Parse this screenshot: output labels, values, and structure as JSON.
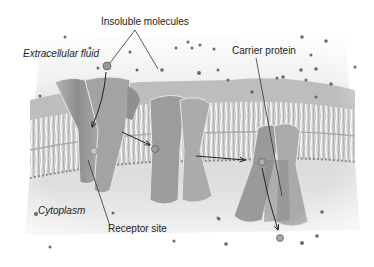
{
  "diagram": {
    "type": "cell-membrane-carrier-transport",
    "labels": {
      "insoluble_molecules": "Insoluble molecules",
      "extracellular_fluid": "Extracellular fluid",
      "carrier_protein": "Carrier protein",
      "cytoplasm": "Cytoplasm",
      "receptor_site": "Receptor site"
    },
    "regions": [
      {
        "name": "extracellular-fluid",
        "position": "top"
      },
      {
        "name": "lipid-bilayer",
        "position": "middle"
      },
      {
        "name": "cytoplasm",
        "position": "bottom"
      }
    ],
    "stages": [
      {
        "step": 1,
        "description": "Molecule enters carrier protein and binds to receptor site"
      },
      {
        "step": 2,
        "description": "Carrier protein changes shape"
      },
      {
        "step": 3,
        "description": "Molecule released into cytoplasm"
      }
    ],
    "colors": {
      "background": "#ffffff",
      "fluid": "#e6e6e6",
      "protein": "#9a9a9a",
      "bilayer": "#d0d0d0",
      "molecule": "#666666",
      "arrow": "#222222",
      "text": "#222222"
    }
  }
}
